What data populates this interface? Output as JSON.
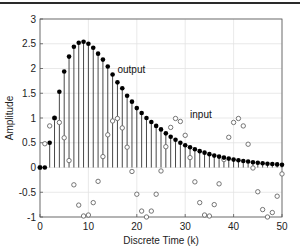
{
  "chart_data": {
    "type": "scatter",
    "subtype": "stem",
    "title": "",
    "xlabel": "Discrete Time (k)",
    "ylabel": "Amplitude",
    "xlim": [
      0,
      50
    ],
    "ylim": [
      -1,
      3
    ],
    "xticks": [
      0,
      10,
      20,
      30,
      40,
      50
    ],
    "yticks": [
      -1,
      -0.5,
      0,
      0.5,
      1,
      1.5,
      2,
      2.5,
      3
    ],
    "grid": true,
    "legend": null,
    "annotations": [
      {
        "text": "output",
        "x": 16,
        "y": 1.9
      },
      {
        "text": "input",
        "x": 31,
        "y": 1.0
      }
    ],
    "x": [
      0,
      1,
      2,
      3,
      4,
      5,
      6,
      7,
      8,
      9,
      10,
      11,
      12,
      13,
      14,
      15,
      16,
      17,
      18,
      19,
      20,
      21,
      22,
      23,
      24,
      25,
      26,
      27,
      28,
      29,
      30,
      31,
      32,
      33,
      34,
      35,
      36,
      37,
      38,
      39,
      40,
      41,
      42,
      43,
      44,
      45,
      46,
      47,
      48,
      49,
      50
    ],
    "series": [
      {
        "name": "output",
        "style": "stem, filled black circles",
        "values": [
          0,
          0,
          0.5,
          1.0,
          1.53,
          1.94,
          2.24,
          2.44,
          2.52,
          2.54,
          2.5,
          2.42,
          2.3,
          2.18,
          2.04,
          1.88,
          1.72,
          1.6,
          1.45,
          1.33,
          1.2,
          1.1,
          1.0,
          0.92,
          0.84,
          0.77,
          0.69,
          0.62,
          0.56,
          0.5,
          0.45,
          0.41,
          0.37,
          0.33,
          0.3,
          0.27,
          0.24,
          0.22,
          0.2,
          0.18,
          0.16,
          0.145,
          0.13,
          0.12,
          0.105,
          0.095,
          0.085,
          0.077,
          0.07,
          0.063,
          0.057
        ]
      },
      {
        "name": "input",
        "style": "open gray circles",
        "values": [
          0,
          0.48,
          0.84,
          1.0,
          0.91,
          0.6,
          0.14,
          -0.35,
          -0.76,
          -0.98,
          -0.96,
          -0.71,
          -0.28,
          0.22,
          0.66,
          0.94,
          0.99,
          0.8,
          0.41,
          -0.08,
          -0.54,
          -0.88,
          -1.0,
          -0.88,
          -0.54,
          -0.07,
          0.42,
          0.81,
          0.99,
          0.93,
          0.65,
          0.2,
          -0.29,
          -0.71,
          -0.96,
          -0.98,
          -0.75,
          -0.33,
          0.16,
          0.61,
          0.91,
          0.99,
          0.84,
          0.47,
          -0.01,
          -0.49,
          -0.85,
          -1.0,
          -0.91,
          -0.58,
          -0.13
        ]
      }
    ]
  },
  "labels": {
    "xlabel": "Discrete Time (k)",
    "ylabel": "Amplitude",
    "output_annotation": "output",
    "input_annotation": "input"
  }
}
